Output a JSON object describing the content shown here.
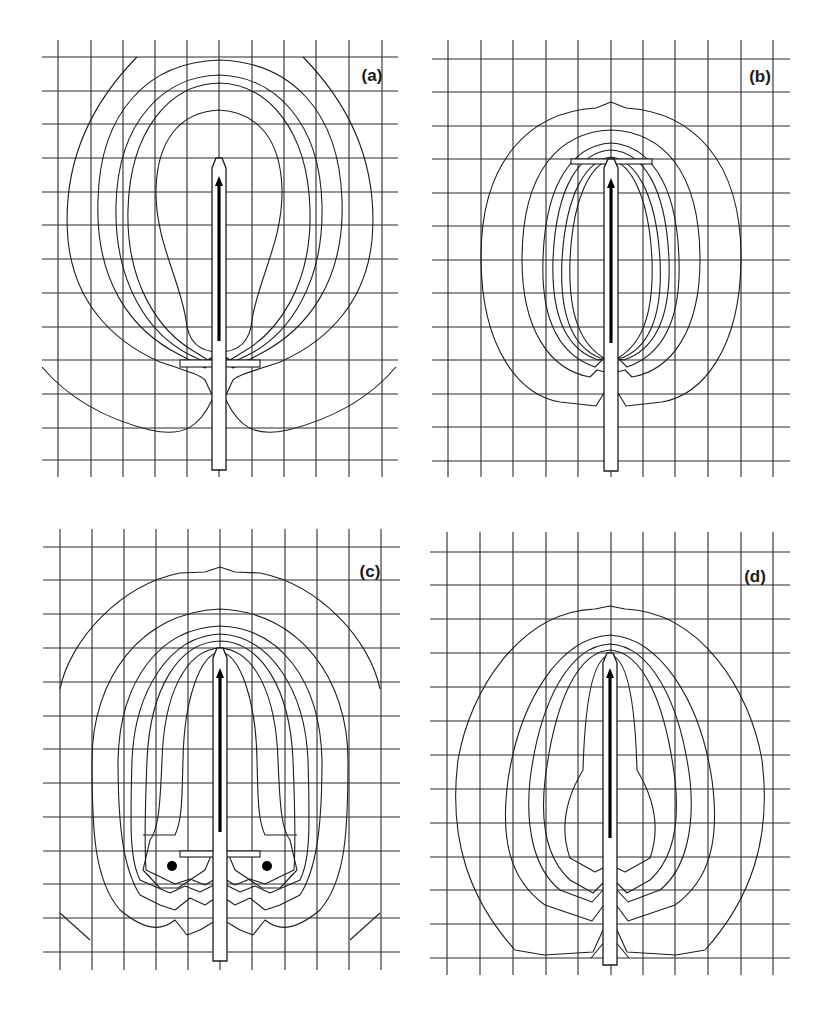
{
  "figure": {
    "panels": [
      {
        "id": "a",
        "label": "(a)",
        "label_pos": [
          372,
          81
        ],
        "grid": {
          "x_lines": [
            58,
            91,
            123,
            155,
            187,
            219,
            252,
            284,
            316,
            349,
            382
          ],
          "y_lines": [
            57,
            91,
            124,
            158,
            192,
            225,
            259,
            293,
            327,
            360,
            394,
            428,
            460
          ],
          "x_span": [
            42,
            398
          ],
          "y_span": [
            40,
            477
          ]
        },
        "probe": {
          "cx": 219,
          "half_width": 7,
          "tip_y": 158,
          "shoulder_y": 168,
          "bottom_y": 470
        },
        "arrow": {
          "x": 219,
          "y_start": 341,
          "y_end": 176
        },
        "plate": {
          "x": 180,
          "y": 360,
          "w": 80,
          "h": 7
        },
        "dots": [],
        "contours": [
          "M137,57 C85,110 62,170 68,240 C74,300 110,340 160,362 C190,372 200,375 205,380 L212,395 M226,395 L233,380 C238,375 250,372 280,362 C330,340 366,300 372,240 C378,170 355,110 303,57",
          "M219,60 C150,62 100,110 98,200 C95,280 130,330 180,355 L205,368 L214,360 L219,358 L224,360 L233,368 L258,355 C308,330 345,280 342,200 C339,110 290,62 219,60",
          "M219,75 C165,76 118,120 116,205 C114,285 150,335 190,355 L205,362 L214,356 L219,355 L224,356 L233,362 L248,355 C288,335 324,285 322,205 C320,120 273,76 219,75",
          "M219,83 C170,84 130,130 128,210 C126,285 160,332 195,352 L208,360 L219,356 L230,360 L243,352 C278,332 312,285 310,210 C308,130 268,84 219,83",
          "M219,110 C180,112 157,140 156,190 C155,240 180,280 186,320 C188,342 200,352 219,352 C238,352 250,342 252,320 C258,280 283,240 282,190 C281,140 258,112 219,110",
          "M42,367 C70,400 110,420 150,430 C185,438 200,425 212,400 L219,385 L226,400 C238,425 253,438 288,430 C328,420 368,400 396,367"
        ]
      },
      {
        "id": "b",
        "label": "(b)",
        "label_pos": [
          760,
          82
        ],
        "grid": {
          "x_lines": [
            448,
            481,
            513,
            546,
            578,
            611,
            643,
            675,
            708,
            741,
            773
          ],
          "y_lines": [
            59,
            92,
            126,
            159,
            193,
            226,
            260,
            293,
            327,
            360,
            394,
            427,
            461
          ],
          "x_span": [
            432,
            790
          ],
          "y_span": [
            40,
            477
          ]
        },
        "probe": {
          "cx": 611,
          "half_width": 7,
          "tip_y": 159,
          "shoulder_y": 168,
          "bottom_y": 471
        },
        "arrow": {
          "x": 611,
          "y_start": 343,
          "y_end": 178
        },
        "plate": {
          "x": 571,
          "y": 159,
          "w": 81,
          "h": 5
        },
        "dots": [],
        "contours": [
          "M611,102 L596,108 C530,112 480,160 481,260 C482,350 520,395 560,402 L596,406 L604,393 L611,389 L618,393 L626,406 L662,402 C702,395 740,350 741,260 C742,160 692,112 626,108 L611,102",
          "M611,130 C560,132 522,170 522,260 C522,330 550,370 590,377 L597,370 L605,372 L611,366 L617,372 L625,370 L632,377 C672,370 700,330 700,260 C700,170 662,132 611,130",
          "M611,143 C575,145 545,180 543,260 C541,320 560,355 595,367 L604,358 L611,355 L618,358 L627,367 C662,355 681,320 679,260 C677,180 647,145 611,143",
          "M611,150 C580,152 556,185 553,260 C551,320 568,350 598,360 L611,357 L624,360 C654,350 671,320 669,260 C666,185 642,152 611,150",
          "M611,157 C588,160 566,190 562,260 C559,320 575,348 600,358 L622,358 C647,348 663,320 660,260 C656,190 634,160 611,157",
          "M611,160 C592,163 573,195 570,260 C568,318 582,345 604,358 L618,358 C640,345 654,318 652,260 C649,195 630,163 611,160"
        ]
      },
      {
        "id": "c",
        "label": "(c)",
        "label_pos": [
          370,
          577
        ],
        "grid": {
          "x_lines": [
            60,
            92,
            124,
            156,
            188,
            220,
            252,
            285,
            317,
            349,
            381
          ],
          "y_lines": [
            547,
            580,
            614,
            648,
            682,
            716,
            749,
            783,
            817,
            851,
            884,
            918,
            952
          ],
          "x_span": [
            43,
            400
          ],
          "y_span": [
            529,
            970
          ]
        },
        "probe": {
          "cx": 220,
          "half_width": 7,
          "tip_y": 648,
          "shoulder_y": 658,
          "bottom_y": 961
        },
        "arrow": {
          "x": 220,
          "y_start": 832,
          "y_end": 668
        },
        "plate": {
          "x": 180,
          "y": 851,
          "w": 80,
          "h": 6
        },
        "dots": [
          {
            "cx": 172,
            "cy": 866,
            "r": 5
          },
          {
            "cx": 267,
            "cy": 866,
            "r": 5
          }
        ],
        "contours": [
          "M60,689 C70,640 120,585 180,573 L205,572 L220,567 L235,572 L260,573 C320,585 370,640 380,689",
          "M60,913 L90,940 M380,913 L350,940",
          "M220,609 C140,612 92,680 92,760 C92,830 94,880 120,910 C150,935 165,928 175,920 L187,935 L200,930 L220,918 L240,930 L253,935 L265,920 C275,928 290,935 320,910 C346,880 348,830 348,760 C348,680 300,612 220,609",
          "M220,626 C160,628 120,680 118,760 C118,830 124,870 140,895 L160,905 L175,910 L190,898 L205,905 L220,895 L235,905 L250,898 L265,910 L280,905 L300,895 C316,870 322,830 322,760 C320,680 280,628 220,626",
          "M220,634 C170,636 135,690 132,760 C130,830 130,860 140,880 L170,893 L185,886 L200,892 L220,882 L240,892 L255,886 L270,893 L300,880 C310,860 310,830 308,760 C305,690 270,636 220,634",
          "M220,641 C178,642 150,690 147,760 C145,810 144,840 146,870 L175,884 L190,879 L205,885 L220,876 L235,885 L250,879 L265,884 L294,870 C296,840 295,810 293,760 C290,690 262,642 220,641",
          "M220,648 C185,650 164,695 162,760 C160,810 158,830 150,840 L143,870 L160,888 L178,888 L205,870 L213,851 M227,851 L235,870 L262,888 L280,888 L297,870 L290,840 C282,830 280,810 278,760 C276,695 255,650 220,648",
          "M220,652 C200,654 184,700 183,760 C182,800 182,820 175,835 L143,835 M220,652 C240,654 256,700 257,760 C258,800 258,820 265,835 L297,835"
        ]
      },
      {
        "id": "d",
        "label": "(d)",
        "label_pos": [
          755,
          582
        ],
        "grid": {
          "x_lines": [
            447,
            480,
            513,
            546,
            578,
            611,
            643,
            675,
            708,
            741,
            773
          ],
          "y_lines": [
            552,
            585,
            619,
            653,
            687,
            721,
            755,
            789,
            823,
            857,
            890,
            924,
            958
          ],
          "x_span": [
            430,
            790
          ],
          "y_span": [
            532,
            975
          ]
        },
        "probe": {
          "cx": 610,
          "half_width": 7,
          "tip_y": 653,
          "shoulder_y": 663,
          "bottom_y": 965
        },
        "arrow": {
          "x": 610,
          "y_start": 838,
          "y_end": 668
        },
        "plate": null,
        "dots": [],
        "contours": [
          "M610,606 L595,609 C520,612 470,690 458,760 C448,840 470,900 515,950 L544,955 L593,952 L603,930 L610,924 L617,930 L627,952 L676,955 L705,950 C750,900 772,840 762,760 C750,690 700,612 625,609 L610,606",
          "M610,635 C560,638 520,700 508,780 C500,840 510,880 545,905 L592,921 L603,906 L610,903 L617,906 L628,921 L675,905 C710,880 720,840 712,780 C700,700 660,638 610,635",
          "M610,644 C570,646 540,700 530,780 C525,830 535,870 560,890 L592,902 L603,890 L610,887 L617,890 L628,902 L660,890 C685,870 695,830 690,780 C680,700 650,646 610,644",
          "M610,650 C578,652 555,700 545,780 C540,825 548,860 570,880 L593,893 L603,883 L610,880 L617,883 L627,893 L650,880 C672,860 680,825 675,780 C665,700 642,652 610,650",
          "M610,655 C593,657 585,700 583,770 C565,800 560,830 570,858 L595,872 L603,868 L617,868 L625,872 L650,858 C660,830 655,800 637,770 C635,700 627,657 610,655",
          "M591,958 L610,935 L629,958"
        ]
      }
    ]
  }
}
